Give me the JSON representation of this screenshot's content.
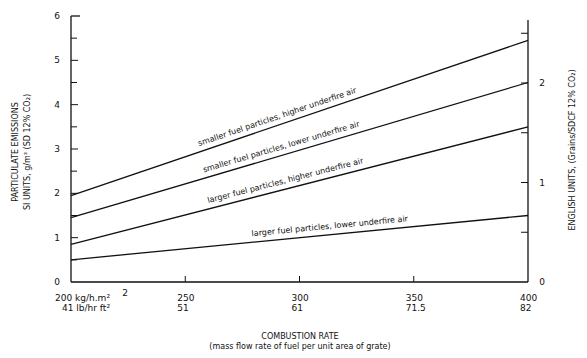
{
  "chart_data": {
    "type": "line",
    "title": "",
    "xlabel": "COMBUSTION RATE",
    "xlabel_sub": "(mass flow rate of fuel per unit area of grate)",
    "ylabel": "PARTICULATE EMISSIONS",
    "ylabel_sub": "SI UNITS, g/m³ (SD 12% CO₂)",
    "ylabel_right": "ENGLISH UNITS, (Grains/SDCF 12% CO₂)",
    "x": [
      200,
      400
    ],
    "xlim": [
      200,
      400
    ],
    "ylim": [
      0,
      6
    ],
    "ylim_right": [
      0,
      2.6
    ],
    "grid": false,
    "legend": "inline labels on lines",
    "x_ticks": [
      {
        "si": "200 kg/h.m²",
        "english": "41 lb/hr ft²"
      },
      {
        "si": "250",
        "english": "51"
      },
      {
        "si": "300",
        "english": "61"
      },
      {
        "si": "350",
        "english": "71.5"
      },
      {
        "si": "400",
        "english": "82"
      }
    ],
    "x_stray_label": "2",
    "y_ticks_left": [
      "0",
      "1",
      "2",
      "3",
      "4",
      "5",
      "6"
    ],
    "y_ticks_right": [
      "0",
      "1",
      "2"
    ],
    "series": [
      {
        "name": "smaller fuel particles, higher underfire air",
        "values": [
          1.95,
          5.45
        ]
      },
      {
        "name": "smaller fuel particles, lower underfire air",
        "values": [
          1.45,
          4.5
        ]
      },
      {
        "name": "larger fuel particles, higher underfire air",
        "values": [
          0.85,
          3.5
        ]
      },
      {
        "name": "larger fuel particles, lower underfire air",
        "values": [
          0.5,
          1.5
        ]
      }
    ]
  }
}
